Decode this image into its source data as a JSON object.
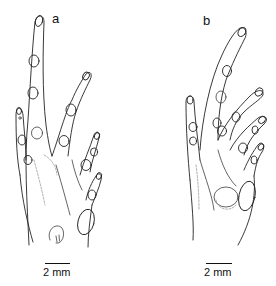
{
  "figure": {
    "panels": [
      {
        "label": "a",
        "subject": "hand-drawing",
        "scale_bar": {
          "label": "2 mm"
        }
      },
      {
        "label": "b",
        "subject": "hand-drawing",
        "scale_bar": {
          "label": "2 mm"
        }
      }
    ]
  }
}
